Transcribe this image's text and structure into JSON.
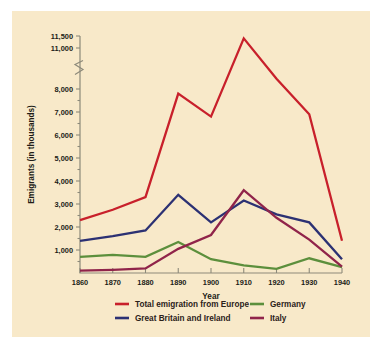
{
  "figure": {
    "background_color": "#f8e9c9",
    "page_background": "#ffffff"
  },
  "chart_data": {
    "type": "line",
    "title": "",
    "xlabel": "Year",
    "ylabel": "Emigrants (in thousands)",
    "x": [
      1860,
      1870,
      1880,
      1890,
      1900,
      1910,
      1920,
      1930,
      1940
    ],
    "xtick_labels": [
      "1860",
      "1870",
      "1880",
      "1890",
      "1900",
      "1910",
      "1920",
      "1930",
      "1940"
    ],
    "xlim": [
      1860,
      1940
    ],
    "ytick_labels": [
      "1,000",
      "2,000",
      "3,000",
      "4,000",
      "5,000",
      "6,000",
      "7,000",
      "8,000",
      "11,000",
      "11,500"
    ],
    "ytick_values": [
      1000,
      2000,
      3000,
      4000,
      5000,
      6000,
      7000,
      8000,
      11000,
      11500
    ],
    "ylim": [
      0,
      11500
    ],
    "axis_break": {
      "present": true,
      "between": [
        8000,
        11000
      ],
      "note": "broken y-axis above 8,000"
    },
    "grid": false,
    "legend_position": "below-plot",
    "series": [
      {
        "name": "Total emigration from Europe",
        "color": "#c8202b",
        "values": [
          2300,
          2750,
          3300,
          7800,
          6800,
          11400,
          8750,
          6900,
          1400
        ]
      },
      {
        "name": "Great Britain and Ireland",
        "color": "#2c3173",
        "values": [
          1400,
          1600,
          1850,
          3400,
          2200,
          3150,
          2550,
          2200,
          600
        ]
      },
      {
        "name": "Germany",
        "color": "#5c8f3c",
        "values": [
          700,
          790,
          700,
          1350,
          600,
          330,
          180,
          640,
          260
        ]
      },
      {
        "name": "Italy",
        "color": "#90244a",
        "values": [
          100,
          140,
          200,
          1050,
          1650,
          3600,
          2400,
          1450,
          280
        ]
      }
    ]
  },
  "legend": {
    "entries": [
      {
        "label": "Total emigration from Europe",
        "color": "#c8202b"
      },
      {
        "label": "Great Britain and Ireland",
        "color": "#2c3173"
      },
      {
        "label": "Germany",
        "color": "#5c8f3c"
      },
      {
        "label": "Italy",
        "color": "#90244a"
      }
    ]
  }
}
